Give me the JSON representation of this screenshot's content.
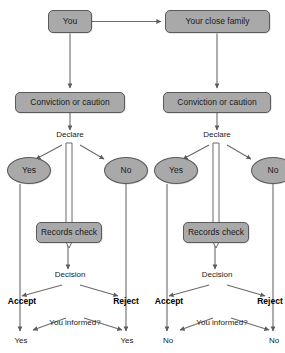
{
  "diagram": {
    "colors": {
      "node_fill": "#a9a9a9",
      "node_stroke": "#5a5a5a",
      "connector": "#6b6b6b",
      "text": "#1a1a1a",
      "background": "#ffffff"
    },
    "branches": [
      {
        "id": "left",
        "subject": "You",
        "stage_record": "Conviction or caution",
        "declare_label": "Declare",
        "declare_yes": "Yes",
        "declare_no": "No",
        "records_check": "Records check",
        "decision_label": "Decision",
        "decision_accept": "Accept",
        "decision_reject": "Reject",
        "informed_label": "You informed?",
        "informed_accept_answer": "Yes",
        "informed_reject_answer": "Yes"
      },
      {
        "id": "right",
        "subject": "Your close family",
        "stage_record": "Conviction or caution",
        "declare_label": "Declare",
        "declare_yes": "Yes",
        "declare_no": "No",
        "records_check": "Records check",
        "decision_label": "Decision",
        "decision_accept": "Accept",
        "decision_reject": "Reject",
        "informed_label": "You informed?",
        "informed_accept_answer": "No",
        "informed_reject_answer": "No"
      }
    ]
  }
}
